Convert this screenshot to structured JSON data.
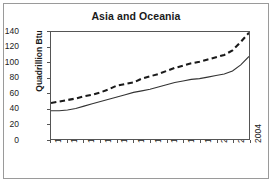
{
  "chart_data": {
    "type": "line",
    "title": "Asia and Oceania",
    "xlabel": "",
    "ylabel": "Quadrillion Btu",
    "xlim": [
      1980,
      2004
    ],
    "ylim": [
      0,
      140
    ],
    "grid": false,
    "legend": "none",
    "x": [
      1980,
      1981,
      1982,
      1983,
      1984,
      1985,
      1986,
      1987,
      1988,
      1989,
      1990,
      1991,
      1992,
      1993,
      1994,
      1995,
      1996,
      1997,
      1998,
      1999,
      2000,
      2001,
      2002,
      2003,
      2004
    ],
    "xticks": [
      "1980",
      "1982",
      "1984",
      "1986",
      "1988",
      "1990",
      "1992",
      "1994",
      "1996",
      "1998",
      "2000",
      "2002",
      "2004"
    ],
    "yticks": [
      "0",
      "20",
      "40",
      "60",
      "80",
      "100",
      "120",
      "140"
    ],
    "series": [
      {
        "name": "dashed-upper",
        "style": "dashed",
        "color": "#1a1a1a",
        "values": [
          47,
          49,
          51,
          53,
          56,
          58,
          61,
          65,
          70,
          72,
          74,
          79,
          82,
          85,
          89,
          93,
          96,
          99,
          101,
          104,
          107,
          110,
          116,
          127,
          139
        ]
      },
      {
        "name": "solid-lower",
        "style": "solid",
        "color": "#333333",
        "values": [
          37,
          37,
          38,
          40,
          43,
          46,
          49,
          52,
          55,
          58,
          61,
          63,
          65,
          68,
          71,
          74,
          76,
          78,
          79,
          81,
          83,
          85,
          89,
          97,
          108
        ]
      }
    ]
  },
  "axes": {
    "y_label": "Quadrillion Btu",
    "y_ticks": [
      "140",
      "120",
      "100",
      "80",
      "60",
      "40",
      "20",
      "0"
    ],
    "x_ticks": [
      "1980",
      "1982",
      "1984",
      "1986",
      "1988",
      "1990",
      "1992",
      "1994",
      "1996",
      "1998",
      "2000",
      "2002",
      "2004"
    ]
  },
  "colors": {
    "frame": "#9a9a9a",
    "axis": "#555555",
    "text": "#1a1a1a",
    "series_dashed": "#1a1a1a",
    "series_solid": "#333333",
    "background": "#ffffff"
  }
}
